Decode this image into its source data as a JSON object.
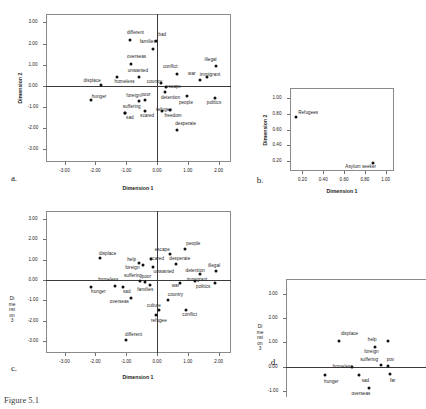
{
  "figure": {
    "caption": "Figure 5.1"
  },
  "chart_data": [
    {
      "id": "a",
      "type": "scatter",
      "panel_letter": "a.",
      "title": "",
      "xlabel": "Dimension 1",
      "ylabel": "Dimension 2",
      "xlim": [
        -3.6,
        2.4
      ],
      "ylim": [
        -3.6,
        3.4
      ],
      "xticks": [
        "-3.00",
        "-2.00",
        "-1.00",
        "0.00",
        "1.00",
        "2.00"
      ],
      "xtickvals": [
        -3,
        -2,
        -1,
        0,
        1,
        2
      ],
      "yticks": [
        "3.00",
        "2.00",
        "1.00",
        "0.00",
        "-1.00",
        "-2.00",
        "-3.00"
      ],
      "ytickvals": [
        3,
        2,
        1,
        0,
        -1,
        -2,
        -3
      ],
      "grid": false,
      "legend": "none",
      "points": [
        {
          "label": "different",
          "x": -0.86,
          "y": 2.17,
          "lx": -0.7,
          "ly": 2.48
        },
        {
          "label": "bad",
          "x": -0.03,
          "y": 2.11,
          "lx": 0.17,
          "ly": 2.42
        },
        {
          "label": "families",
          "x": -0.12,
          "y": 1.73,
          "lx": -0.3,
          "ly": 2.07
        },
        {
          "label": "overseas",
          "x": -0.83,
          "y": 1.05,
          "lx": -0.66,
          "ly": 1.38
        },
        {
          "label": "unwanted",
          "x": -0.6,
          "y": 0.42,
          "lx": -0.62,
          "ly": 0.7
        },
        {
          "label": "conflict",
          "x": 0.64,
          "y": 0.58,
          "lx": 0.43,
          "ly": 0.88
        },
        {
          "label": "illegal",
          "x": 1.9,
          "y": 0.93,
          "lx": 1.74,
          "ly": 1.23
        },
        {
          "label": "war",
          "x": 1.38,
          "y": 0.3,
          "lx": 1.13,
          "ly": 0.55
        },
        {
          "label": "immigrant",
          "x": 1.62,
          "y": 0.42,
          "lx": 1.72,
          "ly": 0.5
        },
        {
          "label": "displace",
          "x": -1.83,
          "y": 0.06,
          "lx": -2.1,
          "ly": 0.25
        },
        {
          "label": "homeless",
          "x": -1.3,
          "y": 0.4,
          "lx": -1.05,
          "ly": 0.17
        },
        {
          "label": "country",
          "x": 0.14,
          "y": 0.13,
          "lx": -0.08,
          "ly": 0.2
        },
        {
          "label": "escape",
          "x": 0.3,
          "y": -0.07,
          "lx": 0.54,
          "ly": -0.06
        },
        {
          "label": "hunger",
          "x": -2.15,
          "y": -0.68,
          "lx": -1.88,
          "ly": -0.52
        },
        {
          "label": "foreign",
          "x": -0.58,
          "y": -0.7,
          "lx": -0.76,
          "ly": -0.47
        },
        {
          "label": "poor",
          "x": -0.4,
          "y": -0.66,
          "lx": -0.36,
          "ly": -0.45
        },
        {
          "label": "detention",
          "x": 0.26,
          "y": -0.28,
          "lx": 0.44,
          "ly": -0.58
        },
        {
          "label": "people",
          "x": 0.97,
          "y": -0.5,
          "lx": 0.94,
          "ly": -0.79
        },
        {
          "label": "politics",
          "x": 1.88,
          "y": -0.56,
          "lx": 1.85,
          "ly": -0.8
        },
        {
          "label": "suffering",
          "x": -1.05,
          "y": -1.26,
          "lx": -0.82,
          "ly": -1.02
        },
        {
          "label": "refugee",
          "x": 0.16,
          "y": -1.18,
          "lx": 0.23,
          "ly": -1.12
        },
        {
          "label": "sad",
          "x": -1.03,
          "y": -1.27,
          "lx": -0.88,
          "ly": -1.5
        },
        {
          "label": "scared",
          "x": -0.38,
          "y": -1.17,
          "lx": -0.32,
          "ly": -1.44
        },
        {
          "label": "freedom",
          "x": 0.42,
          "y": -1.13,
          "lx": 0.52,
          "ly": -1.44
        },
        {
          "label": "desperate",
          "x": 0.66,
          "y": -2.08,
          "lx": 0.93,
          "ly": -1.82
        }
      ]
    },
    {
      "id": "b",
      "type": "scatter",
      "panel_letter": "b.",
      "title": "",
      "xlabel": "Dimension 1",
      "ylabel": "Dimension 2",
      "xlim": [
        0.08,
        1.08
      ],
      "ylim": [
        0.08,
        1.12
      ],
      "xticks": [
        "0.20",
        "0.40",
        "0.60",
        "0.80",
        "1.00"
      ],
      "xtickvals": [
        0.2,
        0.4,
        0.6,
        0.8,
        1.0
      ],
      "yticks": [
        "1.00",
        "0.80",
        "0.60",
        "0.40",
        "0.20"
      ],
      "ytickvals": [
        1.0,
        0.8,
        0.6,
        0.4,
        0.2
      ],
      "grid": false,
      "legend": "none",
      "points": [
        {
          "label": "Refugees",
          "x": 0.135,
          "y": 0.762,
          "lx": 0.255,
          "ly": 0.812
        },
        {
          "label": "Asylum seeker",
          "x": 0.88,
          "y": 0.178,
          "lx": 0.76,
          "ly": 0.128
        }
      ]
    },
    {
      "id": "c",
      "type": "scatter",
      "panel_letter": "c.",
      "title": "",
      "xlabel": "Dimension 1",
      "ylabel": "Dimension 3",
      "xlim": [
        -3.6,
        2.4
      ],
      "ylim": [
        -3.6,
        3.4
      ],
      "xticks": [
        "-3.00",
        "-2.00",
        "-1.00",
        "0.00",
        "1.00",
        "2.00"
      ],
      "xtickvals": [
        -3,
        -2,
        -1,
        0,
        1,
        2
      ],
      "yticks": [
        "3.00",
        "2.00",
        "1.00",
        "0.00",
        "-1.00",
        "-2.00",
        "-3.00"
      ],
      "ytickvals": [
        3,
        2,
        1,
        0,
        -1,
        -2,
        -3
      ],
      "grid": false,
      "legend": "none",
      "points": [
        {
          "label": "people",
          "x": 0.92,
          "y": 1.54,
          "lx": 1.18,
          "ly": 1.78
        },
        {
          "label": "escape",
          "x": 0.42,
          "y": 1.28,
          "lx": 0.17,
          "ly": 1.5
        },
        {
          "label": "displace",
          "x": -1.85,
          "y": 1.06,
          "lx": -1.6,
          "ly": 1.3
        },
        {
          "label": "scared",
          "x": -0.2,
          "y": 1.02,
          "lx": 0.0,
          "ly": 1.02
        },
        {
          "label": "desperate",
          "x": 0.63,
          "y": 0.8,
          "lx": 0.74,
          "ly": 1.02
        },
        {
          "label": "help",
          "x": -0.57,
          "y": 0.82,
          "lx": -0.82,
          "ly": 1.0
        },
        {
          "label": "foreign",
          "x": -0.45,
          "y": 0.76,
          "lx": -0.8,
          "ly": 0.58
        },
        {
          "label": "unwanted",
          "x": -0.13,
          "y": 0.64,
          "lx": 0.22,
          "ly": 0.4
        },
        {
          "label": "detention",
          "x": 1.38,
          "y": 0.3,
          "lx": 1.24,
          "ly": 0.44
        },
        {
          "label": "illegal",
          "x": 1.9,
          "y": 0.45,
          "lx": 1.85,
          "ly": 0.7
        },
        {
          "label": "suffering",
          "x": -0.54,
          "y": -0.06,
          "lx": -0.78,
          "ly": 0.18
        },
        {
          "label": "poor",
          "x": -0.38,
          "y": -0.08,
          "lx": -0.34,
          "ly": 0.14
        },
        {
          "label": "homeless",
          "x": -1.36,
          "y": -0.3,
          "lx": -1.58,
          "ly": 0.02
        },
        {
          "label": "immigrant",
          "x": 1.22,
          "y": -0.05,
          "lx": 1.3,
          "ly": 0.02
        },
        {
          "label": "war",
          "x": 0.76,
          "y": -0.14,
          "lx": 0.6,
          "ly": -0.32
        },
        {
          "label": "politics",
          "x": 1.88,
          "y": -0.16,
          "lx": 1.5,
          "ly": -0.34
        },
        {
          "label": "hunger",
          "x": -2.15,
          "y": -0.35,
          "lx": -1.9,
          "ly": -0.6
        },
        {
          "label": "sad",
          "x": -1.1,
          "y": -0.33,
          "lx": -0.98,
          "ly": -0.58
        },
        {
          "label": "families",
          "x": -0.22,
          "y": -0.24,
          "lx": -0.38,
          "ly": -0.5
        },
        {
          "label": "country",
          "x": 0.36,
          "y": -0.97,
          "lx": 0.6,
          "ly": -0.76
        },
        {
          "label": "overseas",
          "x": -0.85,
          "y": -0.88,
          "lx": -1.22,
          "ly": -1.08
        },
        {
          "label": "culture",
          "x": 0.06,
          "y": -1.5,
          "lx": -0.1,
          "ly": -1.3
        },
        {
          "label": "conflict",
          "x": 0.94,
          "y": -1.47,
          "lx": 1.06,
          "ly": -1.72
        },
        {
          "label": "refugee",
          "x": -0.04,
          "y": -1.74,
          "lx": 0.06,
          "ly": -2.02
        },
        {
          "label": "different",
          "x": -1.0,
          "y": -2.98,
          "lx": -0.76,
          "ly": -2.72
        }
      ]
    },
    {
      "id": "d",
      "type": "scatter",
      "panel_letter": "d.",
      "title": "",
      "xlabel": "",
      "ylabel": "Dimension 3",
      "xlim": [
        -2.4,
        1.3
      ],
      "ylim": [
        -1.25,
        3.6
      ],
      "xticks": [],
      "xtickvals": [],
      "yticks": [
        "3.00",
        "2.00",
        "1.00",
        "0.00",
        "-1.00"
      ],
      "ytickvals": [
        3,
        2,
        1,
        0,
        -1
      ],
      "grid": false,
      "legend": "none",
      "clipped": true,
      "points": [
        {
          "label": "displace",
          "x": -1.0,
          "y": 1.06,
          "lx": -0.72,
          "ly": 1.32
        },
        {
          "label": "help",
          "x": -0.06,
          "y": 0.82,
          "lx": -0.12,
          "ly": 1.08
        },
        {
          "label": "foreign",
          "x": 0.3,
          "y": 1.05,
          "lx": -0.14,
          "ly": 0.62
        },
        {
          "label": "suffering",
          "x": 0.1,
          "y": 0.05,
          "lx": -0.2,
          "ly": 0.26
        },
        {
          "label": "pov",
          "x": 0.3,
          "y": 0.04,
          "lx": 0.36,
          "ly": 0.26
        },
        {
          "label": "homeless",
          "x": -0.66,
          "y": -0.03,
          "lx": -0.9,
          "ly": 0.0
        },
        {
          "label": "hunger",
          "x": -1.36,
          "y": -0.36,
          "lx": -1.2,
          "ly": -0.62
        },
        {
          "label": "sad",
          "x": -0.46,
          "y": -0.34,
          "lx": -0.3,
          "ly": -0.6
        },
        {
          "label": "far",
          "x": 0.34,
          "y": -0.3,
          "lx": 0.42,
          "ly": -0.6
        },
        {
          "label": "overseas",
          "x": -0.2,
          "y": -0.88,
          "lx": -0.42,
          "ly": -1.12
        }
      ]
    }
  ]
}
